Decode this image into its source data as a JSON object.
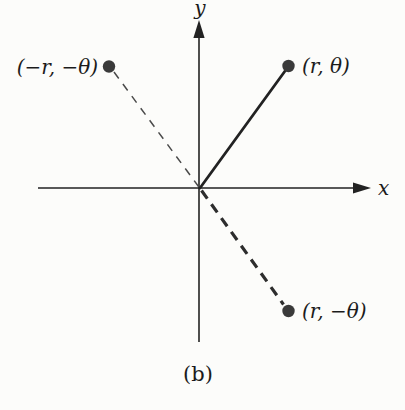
{
  "diagram": {
    "caption": "(b)",
    "x_axis_label": "x",
    "y_axis_label": "y",
    "points": {
      "first_quadrant": {
        "label": "(r, θ)"
      },
      "second_quadrant": {
        "label": "(−r, −θ)"
      },
      "fourth_quadrant": {
        "label": "(r, −θ)"
      }
    },
    "colors": {
      "ink": "#222222",
      "dot": "#3a3a3a",
      "dash_thin": "#4a4a4a",
      "dash_thick": "#2d2d2d",
      "text": "#1b1b1b",
      "background": "#fcfcfa"
    }
  }
}
